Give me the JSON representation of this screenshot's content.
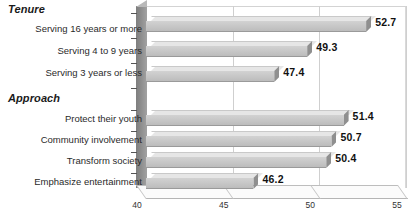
{
  "chart_data": {
    "type": "bar",
    "orientation": "horizontal",
    "style": "3d",
    "title": "",
    "subtitle": "",
    "xlabel": "",
    "ylabel": "",
    "xlim": [
      40,
      55
    ],
    "xticks": [
      40,
      45,
      50,
      55
    ],
    "xtick_labels": [
      "40",
      "45",
      "50",
      "55"
    ],
    "grid": true,
    "grid_axis": "x",
    "legend": false,
    "legend_position": "none",
    "value_labels": true,
    "groups": [
      {
        "name": "Tenure",
        "categories": [
          "Serving 16 years or more",
          "Serving 4 to 9 years",
          "Serving 3 years or less"
        ],
        "values": [
          52.7,
          49.3,
          47.4
        ],
        "value_labels": [
          "52.7",
          "49.3",
          "47.4"
        ]
      },
      {
        "name": "Approach",
        "categories": [
          "Protect their youth",
          "Community involvement",
          "Transform society",
          "Emphasize entertainment"
        ],
        "values": [
          51.4,
          50.7,
          50.4,
          46.2
        ],
        "value_labels": [
          "51.4",
          "50.7",
          "50.4",
          "46.2"
        ]
      }
    ],
    "categories": [
      "Serving 16 years or more",
      "Serving 4 to 9 years",
      "Serving 3 years or less",
      "Protect their youth",
      "Community involvement",
      "Transform society",
      "Emphasize entertainment"
    ],
    "values": [
      52.7,
      49.3,
      47.4,
      51.4,
      50.7,
      50.4,
      46.2
    ],
    "colors": {
      "bar_front": "#c6c6c6",
      "bar_top": "#e6e6e6",
      "bar_cap": "#8f8f8f",
      "axis_wall": "#8d8d8d",
      "gridline": "#cfcfcf",
      "text": "#1a1a1a",
      "background": "#ffffff"
    }
  }
}
